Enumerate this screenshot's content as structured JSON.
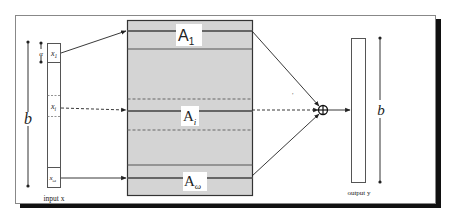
{
  "diagram": {
    "input": {
      "caption": "input x",
      "cells": [
        {
          "label": "x",
          "sub": "1"
        },
        {
          "label": "x",
          "sub": "i"
        },
        {
          "label": "x",
          "sub": "ω"
        }
      ],
      "alpha_label": "α",
      "height_label": "b"
    },
    "blocks": [
      {
        "label": "A",
        "sub": "1"
      },
      {
        "label": "A",
        "sub": "i"
      },
      {
        "label": "A",
        "sub": "ω"
      }
    ],
    "sum_node": "⊕",
    "output": {
      "caption": "output y",
      "height_label": "b"
    },
    "colors": {
      "block_fill": "#d4d4d4",
      "block_border": "#333333",
      "row_line": "#555555",
      "frame_shadow": "#111111",
      "frame_border": "#888888"
    }
  }
}
